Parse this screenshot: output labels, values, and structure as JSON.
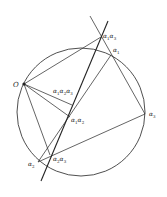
{
  "diagram": {
    "title": "",
    "points": {
      "O": {
        "label": "O"
      },
      "a1": {
        "label": "α",
        "sub": "1"
      },
      "a2": {
        "label": "α",
        "sub": "2"
      },
      "a3": {
        "label": "α",
        "sub": "3"
      },
      "a1a2": {
        "label": "α",
        "sub": "1",
        "label2": "α",
        "sub2": "2"
      },
      "a1a3": {
        "label": "α",
        "sub": "1",
        "label2": "α",
        "sub2": "3"
      },
      "a2a3": {
        "label": "α",
        "sub": "2",
        "label2": "α",
        "sub2": "3"
      },
      "a1a2a3": {
        "label": "α",
        "sub": "1",
        "label2": "α",
        "sub2": "2",
        "label3": "α",
        "sub3": "3"
      }
    },
    "colors": {
      "stroke": "#222222",
      "background": "#ffffff"
    }
  }
}
